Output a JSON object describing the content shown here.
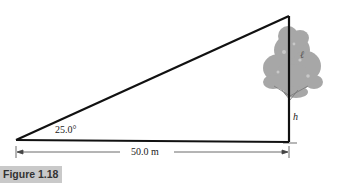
{
  "figure": {
    "caption": "Figure 1.18",
    "angle_label": "25.0°",
    "distance_label": "50.0 m",
    "height_label": "h",
    "canopy_mark": "ℓ",
    "colors": {
      "lines": "#111111",
      "tree_canopy": "#9a9a9a",
      "caption_bg": "#c9c9c9",
      "dimension_line": "#444444"
    }
  }
}
